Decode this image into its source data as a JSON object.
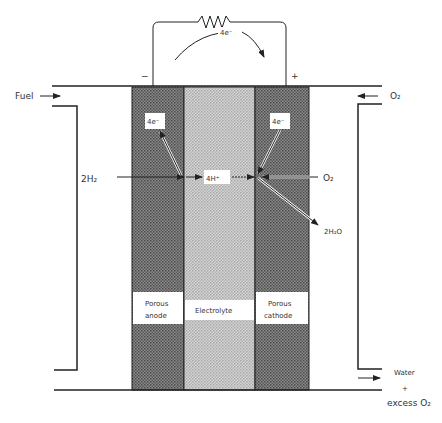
{
  "diagram": {
    "circuit": {
      "electron_flow": "4e⁻",
      "anode_terminal": "−",
      "cathode_terminal": "+"
    },
    "inputs": {
      "fuel": "Fuel",
      "oxidant": "O₂"
    },
    "outputs": {
      "water": "Water",
      "plus": "+",
      "excess_o2": "excess O₂"
    },
    "reactants": {
      "hydrogen": "2H₂",
      "oxygen": "O₂"
    },
    "products": {
      "water": "2H₂O"
    },
    "ions": {
      "proton": "4H⁺",
      "anode_electrons": "4e⁻",
      "cathode_electrons": "4e⁻"
    },
    "layers": {
      "anode": [
        "Porous",
        "anode"
      ],
      "electrolyte": "Electrolyte",
      "cathode": [
        "Porous",
        "cathode"
      ]
    },
    "colors": {
      "electrode": "#7a7a7a",
      "electrolyte": "#c4c4c4",
      "line": "#222222"
    }
  }
}
